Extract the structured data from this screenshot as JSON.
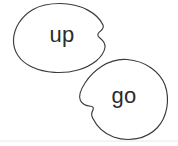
{
  "canvas": {
    "width": 178,
    "height": 146,
    "background_color": "#ffffff"
  },
  "style": {
    "outline_color": "#3a3a3c",
    "outline_width": 1.15,
    "fill_color": "#ffffff",
    "text_color": "#2b2b2d",
    "divider_color": "#e8e8ea"
  },
  "blobs": [
    {
      "id": "blob-up",
      "label": "up",
      "label_x": 62,
      "label_y": 36,
      "font_size": 23,
      "bounds": {
        "x": 13,
        "y": 3,
        "width": 93,
        "height": 70
      },
      "path": "M 60 3.5 C 82 3.5 98 14 103 25 C 104.6 28.4 101 30.5 99.2 32.2 C 97.2 34.1 97.4 36.1 99.6 37.8 C 102.6 40.2 105.8 43.0 105.0 47.5 C 103.2 57.5 92 66 78 70 C 63 74.3 45 73.0 32 67 C 19.5 61.2 13.2 51 13.5 40 C 13.8 28.5 21 16.5 33 9.5 C 41.5 4.6 51 3.5 60 3.5 Z"
    },
    {
      "id": "blob-go",
      "label": "go",
      "label_x": 124,
      "label_y": 97,
      "font_size": 23,
      "bounds": {
        "x": 79,
        "y": 59,
        "width": 88,
        "height": 82
      },
      "path": "M 127 59.5 C 146 61 160 72 165 85 C 170 99 167.5 117 157 128 C 146 139.5 128 142 113.5 137 C 103 133.2 96 125 92.5 117.8 C 91.2 115.0 91.6 112.4 92.8 110.4 C 94.0 108.3 93.2 106.4 90.6 106.2 C 87.0 105.9 82.3 104.2 80.4 100.5 C 78.2 96.1 80.8 89.5 85 83 C 93 70.5 109 58 127 59.5 Z"
    }
  ],
  "divider": {
    "visible": true,
    "y": 141,
    "x1": 0,
    "x2": 178
  }
}
